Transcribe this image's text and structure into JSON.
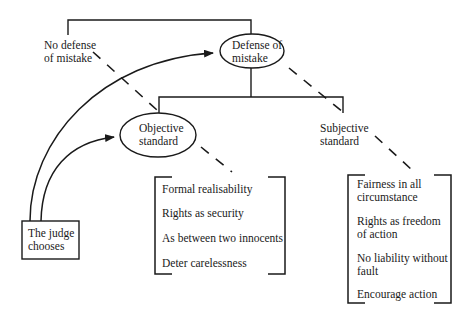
{
  "diagram": {
    "nodes": {
      "defense": {
        "line1": "Defense of",
        "line2": "mistake"
      },
      "no_defense": {
        "line1": "No defense",
        "line2": "of mistake"
      },
      "objective": {
        "line1": "Objective",
        "line2": "standard"
      },
      "subjective": {
        "line1": "Subjective",
        "line2": "standard"
      },
      "judge": {
        "line1": "The judge",
        "line2": "chooses"
      }
    },
    "objective_values": [
      "Formal realisability",
      "Rights as security",
      "As between two innocents",
      "Deter carelessness"
    ],
    "subjective_values": [
      {
        "line1": "Fairness in all",
        "line2": "circumstance"
      },
      {
        "line1": "Rights as freedom",
        "line2": "of action"
      },
      {
        "line1": "No liability without",
        "line2": "fault"
      },
      {
        "line1": "Encourage action",
        "line2": ""
      }
    ],
    "colors": {
      "line": "#1a1a1a",
      "background": "#ffffff"
    }
  }
}
